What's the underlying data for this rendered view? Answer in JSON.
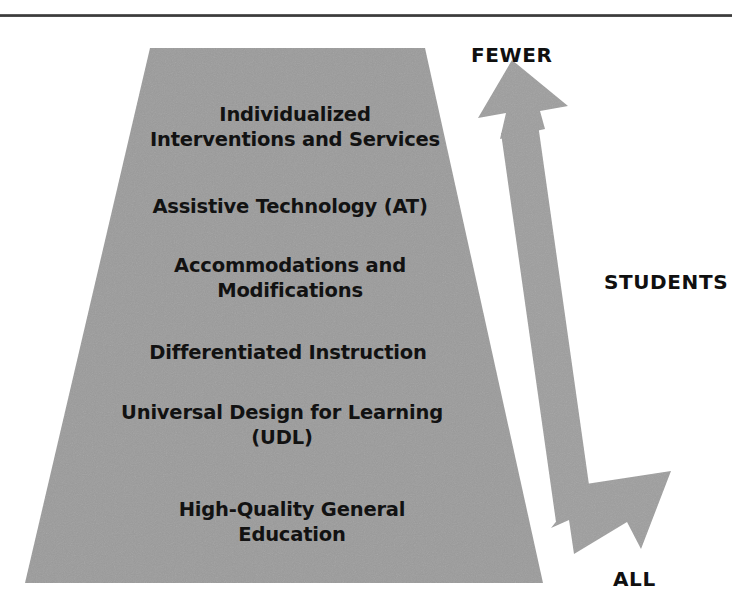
{
  "figure": {
    "type": "pyramid-diagram",
    "colors": {
      "pyramid_fill": "#9b9b9b",
      "arrow_fill": "#9e9e9e",
      "text": "#121212",
      "rule": "#3a3a3a",
      "background": "#ffffff"
    },
    "pyramid": {
      "name": "tiered-supports-pyramid",
      "tiers": [
        {
          "id": "tier-0",
          "label": "Individualized\nInterventions and Services"
        },
        {
          "id": "tier-1",
          "label": "Assistive Technology (AT)"
        },
        {
          "id": "tier-2",
          "label": "Accommodations and\nModifications"
        },
        {
          "id": "tier-3",
          "label": "Differentiated Instruction"
        },
        {
          "id": "tier-4",
          "label": "Universal Design for Learning\n(UDL)"
        },
        {
          "id": "tier-5",
          "label": "High-Quality General\nEducation"
        }
      ]
    },
    "arrow": {
      "name": "students-double-arrow",
      "direction": "double-headed-vertical",
      "top_label": "FEWER",
      "middle_label": "STUDENTS",
      "bottom_label": "ALL"
    }
  }
}
